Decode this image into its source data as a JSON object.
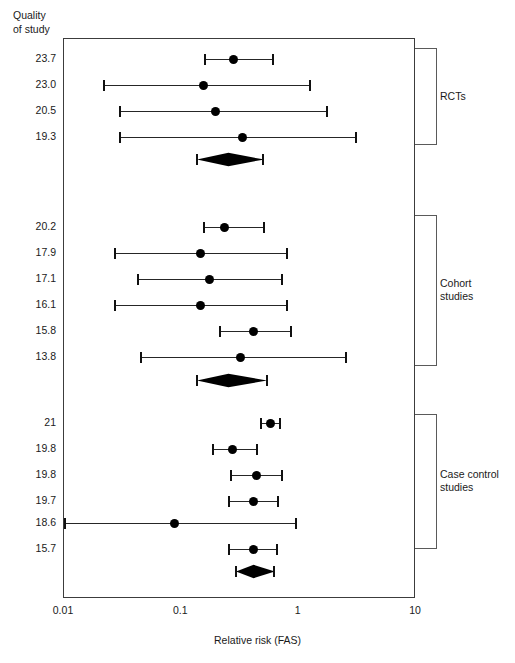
{
  "header": {
    "column_title": "Quality\nof study"
  },
  "axis": {
    "title": "Relative risk (FAS)",
    "scale": "log10",
    "ticks": [
      "0.01",
      "0.1",
      "1",
      "10"
    ],
    "tick_values": [
      0.01,
      0.1,
      1,
      10
    ],
    "min": 0.01,
    "max": 10
  },
  "groups": [
    {
      "name": "RCTs",
      "label": "RCTs"
    },
    {
      "name": "Cohort studies",
      "label": "Cohort\nstudies"
    },
    {
      "name": "Case control studies",
      "label": "Case control\nstudies"
    }
  ],
  "chart_data": {
    "type": "scatter",
    "title": "",
    "subtitle": "",
    "xlabel": "Relative risk (FAS)",
    "ylabel": "Quality of study",
    "xscale": "log",
    "xlim": [
      0.01,
      10
    ],
    "xticks": [
      0.01,
      0.1,
      1,
      10
    ],
    "xticklabels": [
      "0.01",
      "0.1",
      "1",
      "10"
    ],
    "grid": false,
    "legend": "none",
    "y_axis_label_header": "Quality of study",
    "groups": [
      {
        "name": "RCTs",
        "rows": [
          {
            "label": "23.7",
            "estimate": 0.28,
            "ci_low": 0.16,
            "ci_high": 0.6
          },
          {
            "label": "23.0",
            "estimate": 0.155,
            "ci_low": 0.022,
            "ci_high": 1.25
          },
          {
            "label": "20.5",
            "estimate": 0.195,
            "ci_low": 0.03,
            "ci_high": 1.75
          },
          {
            "label": "19.3",
            "estimate": 0.33,
            "ci_low": 0.03,
            "ci_high": 3.1
          }
        ],
        "summary": {
          "label": "",
          "estimate": 0.25,
          "ci_low": 0.135,
          "ci_high": 0.5,
          "shape": "diamond"
        }
      },
      {
        "name": "Cohort studies",
        "rows": [
          {
            "label": "20.2",
            "estimate": 0.235,
            "ci_low": 0.155,
            "ci_high": 0.51
          },
          {
            "label": "17.9",
            "estimate": 0.145,
            "ci_low": 0.027,
            "ci_high": 0.8
          },
          {
            "label": "17.1",
            "estimate": 0.175,
            "ci_low": 0.043,
            "ci_high": 0.72
          },
          {
            "label": "16.1",
            "estimate": 0.145,
            "ci_low": 0.027,
            "ci_high": 0.8
          },
          {
            "label": "15.8",
            "estimate": 0.41,
            "ci_low": 0.215,
            "ci_high": 0.86
          },
          {
            "label": "13.8",
            "estimate": 0.32,
            "ci_low": 0.045,
            "ci_high": 2.55
          }
        ],
        "summary": {
          "label": "",
          "estimate": 0.25,
          "ci_low": 0.135,
          "ci_high": 0.54,
          "shape": "diamond"
        }
      },
      {
        "name": "Case control studies",
        "rows": [
          {
            "label": "21",
            "estimate": 0.58,
            "ci_low": 0.48,
            "ci_high": 0.7
          },
          {
            "label": "19.8",
            "estimate": 0.275,
            "ci_low": 0.185,
            "ci_high": 0.44
          },
          {
            "label": "19.8",
            "estimate": 0.44,
            "ci_low": 0.265,
            "ci_high": 0.72
          },
          {
            "label": "19.7",
            "estimate": 0.41,
            "ci_low": 0.255,
            "ci_high": 0.67
          },
          {
            "label": "18.6",
            "estimate": 0.088,
            "ci_low": 0.01,
            "ci_high": 0.95
          },
          {
            "label": "15.7",
            "estimate": 0.41,
            "ci_low": 0.255,
            "ci_high": 0.66
          }
        ],
        "summary": {
          "label": "",
          "estimate": 0.41,
          "ci_low": 0.29,
          "ci_high": 0.62,
          "shape": "diamond"
        }
      }
    ]
  },
  "style": {
    "marker_color": "#000000",
    "line_color": "#262626",
    "frame_color": "#3c3c3c",
    "bracket_color": "#5a5a5a",
    "text_color": "#1a1a1a",
    "background": "#ffffff"
  }
}
